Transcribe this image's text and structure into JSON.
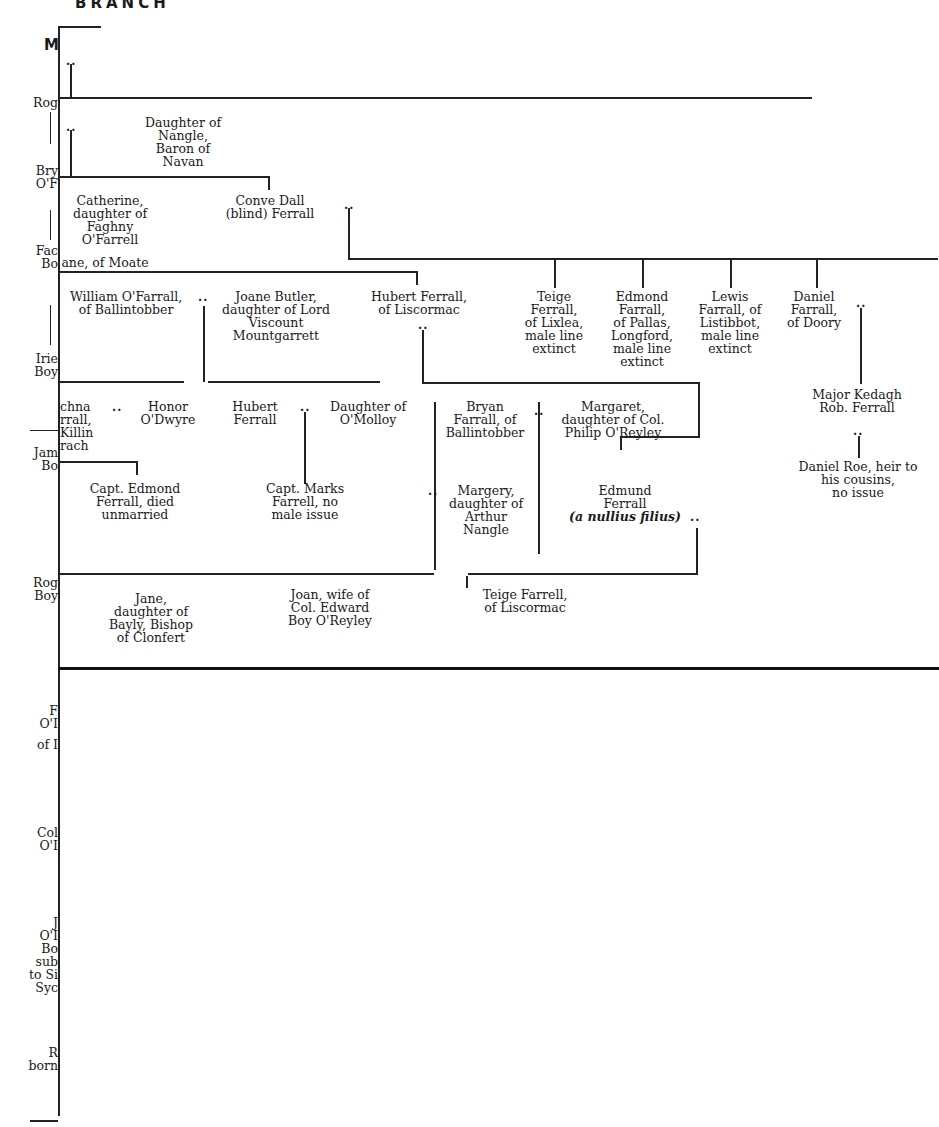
{
  "header": {
    "title": "BRANCH",
    "margin_letter": "M"
  },
  "left_margin_fragments": [
    {
      "lines": [
        "Rog"
      ]
    },
    {
      "lines": [
        "Bry",
        "O'F"
      ]
    },
    {
      "lines": [
        "Fac",
        "Bo"
      ]
    },
    {
      "lines": [
        "Irie",
        "Boy"
      ]
    },
    {
      "lines": [
        "Jam",
        "Bo"
      ]
    },
    {
      "lines": [
        "Rog",
        "Boy"
      ]
    },
    {
      "lines": [
        "F",
        "O'I",
        "",
        "of I"
      ]
    },
    {
      "lines": [
        "Col",
        "O'I"
      ]
    },
    {
      "lines": [
        "J",
        "O'I",
        "Bo",
        "sub",
        "to Si",
        "Syc"
      ]
    },
    {
      "lines": [
        "R",
        "born"
      ]
    }
  ],
  "persons": {
    "daughter_nangle": [
      "Daughter of",
      "Nangle,",
      "Baron of",
      "Navan"
    ],
    "catherine": [
      "Catherine,",
      "daughter of",
      "Faghny",
      "O'Farrell"
    ],
    "catherine_tail": "ane, of Moate",
    "conve_dall": [
      "Conve Dall",
      "(blind) Ferrall"
    ],
    "william": [
      "William O'Farrall,",
      "of Ballintobber"
    ],
    "joane_butler": [
      "Joane Butler,",
      "daughter of  Lord",
      "Viscount",
      "Mountgarrett"
    ],
    "hubert_liscormac": [
      "Hubert Ferrall,",
      "of Liscormac"
    ],
    "teige_lixlea": [
      "Teige",
      "Ferrall,",
      "of Lixlea,",
      "male line",
      "extinct"
    ],
    "edmond_pallas": [
      "Edmond",
      "Farrall,",
      "of Pallas,",
      "Longford,",
      "male line",
      "extinct"
    ],
    "lewis": [
      "Lewis",
      "Farrall, of",
      "Listibbot,",
      "male line",
      "extinct"
    ],
    "daniel_doory": [
      "Daniel",
      "Farrall,",
      "of Doory"
    ],
    "major_kedagh": [
      "Major Kedagh",
      "Rob. Ferrall"
    ],
    "daniel_roe": [
      "Daniel Roe, heir to",
      "his cousins,",
      "no issue"
    ],
    "cahna_fragment": [
      "chna",
      "rrall,",
      "Killin",
      "rach"
    ],
    "honor": [
      "Honor",
      "O'Dwyre"
    ],
    "hubert_ferrall": [
      "Hubert",
      "Ferrall"
    ],
    "daughter_omolloy": [
      "Daughter of",
      "O'Molloy"
    ],
    "bryan": [
      "Bryan",
      "Farrall, of",
      "Ballintobber"
    ],
    "margaret": [
      "Margaret,",
      "daughter of Col.",
      "Philip O'Reyley"
    ],
    "capt_edmond": [
      "Capt. Edmond",
      "Ferrall, died",
      "unmarried"
    ],
    "capt_marks": [
      "Capt. Marks",
      "Farrell, no",
      "male issue"
    ],
    "margery": [
      "Margery,",
      "daughter of",
      "Arthur",
      "Nangle"
    ],
    "edmund": [
      "Edmund",
      "Ferrall"
    ],
    "edmund_note": "(a nullius filius)",
    "jane": [
      "Jane,",
      "daughter of",
      "Bayly, Bishop",
      "of Clonfert"
    ],
    "joan": [
      "Joan, wife of",
      "Col. Edward",
      "Boy O'Reyley"
    ],
    "teige_liscormac": [
      "Teige Farrell,",
      "of Liscormac"
    ]
  },
  "marriage_marker": ".."
}
